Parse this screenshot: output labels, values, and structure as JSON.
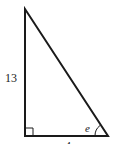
{
  "diagram": {
    "type": "right-triangle",
    "vertices": {
      "top": [
        25,
        9
      ],
      "right_angle": [
        25,
        136
      ],
      "bottom_right": [
        108,
        136
      ]
    },
    "labels": {
      "vertical_side": "13",
      "horizontal_side": "4",
      "angle": "e"
    },
    "colors": {
      "stroke": "#1a1a1a",
      "text": "#222222",
      "background": "#ffffff"
    }
  }
}
